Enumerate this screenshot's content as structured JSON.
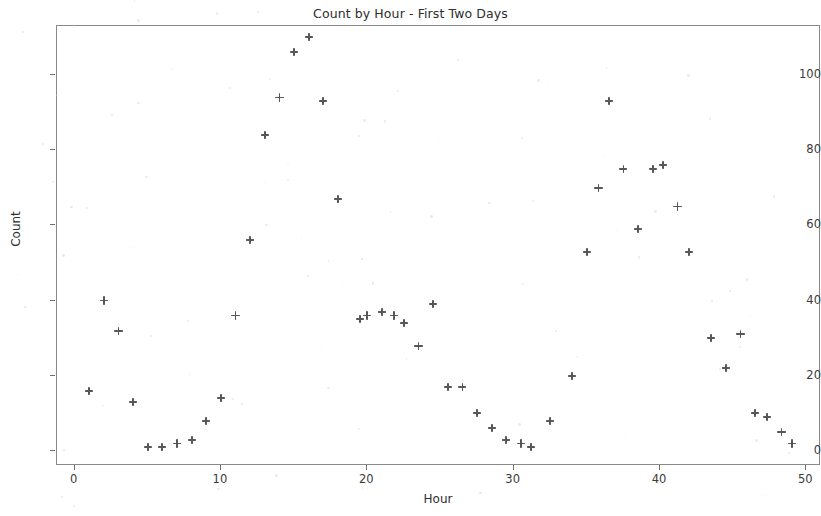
{
  "chart_data": {
    "type": "scatter",
    "title": "Count by Hour - First Two Days",
    "xlabel": "Hour",
    "ylabel": "Count",
    "xlim": [
      -1.2,
      51.0
    ],
    "ylim": [
      -4.0,
      113.0
    ],
    "grid": false,
    "legend": null,
    "marker": "plus",
    "marker_color": "#575757",
    "xticks": [
      0,
      10,
      20,
      30,
      40,
      50
    ],
    "yticks": [
      0,
      20,
      40,
      60,
      80,
      100
    ],
    "x": [
      1,
      2,
      3,
      4,
      5,
      6,
      7,
      8,
      9,
      10,
      11,
      12,
      13,
      14,
      15,
      16,
      17,
      18,
      19,
      20,
      21,
      22,
      23,
      24,
      25,
      26,
      27,
      28,
      29,
      30,
      31,
      32,
      33,
      34,
      35,
      36,
      37,
      38,
      39,
      40,
      41,
      42,
      43,
      44,
      45,
      46,
      47,
      48,
      49
    ],
    "y": [
      16,
      40,
      32,
      13,
      1,
      1,
      2,
      3,
      8,
      14,
      36,
      56,
      84,
      94,
      106,
      110,
      93,
      67,
      35,
      36,
      37,
      36,
      34,
      28,
      39,
      17,
      17,
      10,
      6,
      3,
      2,
      1,
      8,
      20,
      53,
      70,
      93,
      75,
      59,
      75,
      76,
      65,
      53,
      30,
      22,
      31,
      10,
      9,
      5
    ],
    "points": [
      {
        "x": 1,
        "y": 16
      },
      {
        "x": 2,
        "y": 40
      },
      {
        "x": 3,
        "y": 32
      },
      {
        "x": 4,
        "y": 13
      },
      {
        "x": 5,
        "y": 1
      },
      {
        "x": 6,
        "y": 1
      },
      {
        "x": 7,
        "y": 2
      },
      {
        "x": 8,
        "y": 3
      },
      {
        "x": 9,
        "y": 8
      },
      {
        "x": 10,
        "y": 14
      },
      {
        "x": 11,
        "y": 36
      },
      {
        "x": 12,
        "y": 56
      },
      {
        "x": 13,
        "y": 84
      },
      {
        "x": 14,
        "y": 94
      },
      {
        "x": 15,
        "y": 106
      },
      {
        "x": 16,
        "y": 110
      },
      {
        "x": 17,
        "y": 93
      },
      {
        "x": 18,
        "y": 67
      },
      {
        "x": 19.5,
        "y": 35
      },
      {
        "x": 20,
        "y": 36
      },
      {
        "x": 21,
        "y": 37
      },
      {
        "x": 21.8,
        "y": 36
      },
      {
        "x": 22.5,
        "y": 34
      },
      {
        "x": 23.5,
        "y": 28
      },
      {
        "x": 24.5,
        "y": 39
      },
      {
        "x": 25.5,
        "y": 17
      },
      {
        "x": 26.5,
        "y": 17
      },
      {
        "x": 27.5,
        "y": 10
      },
      {
        "x": 28.5,
        "y": 6
      },
      {
        "x": 29.5,
        "y": 3
      },
      {
        "x": 30.5,
        "y": 2
      },
      {
        "x": 31.2,
        "y": 1
      },
      {
        "x": 32.5,
        "y": 8
      },
      {
        "x": 34,
        "y": 20
      },
      {
        "x": 35,
        "y": 53
      },
      {
        "x": 35.8,
        "y": 70
      },
      {
        "x": 36.5,
        "y": 93
      },
      {
        "x": 37.5,
        "y": 75
      },
      {
        "x": 38.5,
        "y": 59
      },
      {
        "x": 39.5,
        "y": 75
      },
      {
        "x": 40.2,
        "y": 76
      },
      {
        "x": 41.2,
        "y": 65
      },
      {
        "x": 42,
        "y": 53
      },
      {
        "x": 43.5,
        "y": 30
      },
      {
        "x": 44.5,
        "y": 22
      },
      {
        "x": 45.5,
        "y": 31
      },
      {
        "x": 46.5,
        "y": 10
      },
      {
        "x": 47.3,
        "y": 9
      },
      {
        "x": 48.3,
        "y": 5
      },
      {
        "x": 49,
        "y": 2
      }
    ]
  }
}
